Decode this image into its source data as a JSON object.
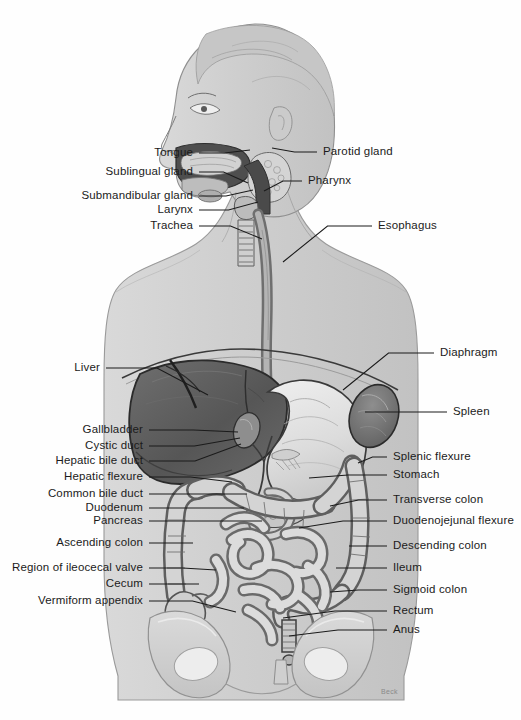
{
  "figure": {
    "signature": "Beck",
    "background_color": "#fefefe",
    "ink_color": "#1b1b1b"
  },
  "labels_left": [
    {
      "text": "Tongue",
      "x": 193,
      "y": 153,
      "tx": 250,
      "ty": 150
    },
    {
      "text": "Sublingual gland",
      "x": 193,
      "y": 172,
      "tx": 248,
      "ty": 183
    },
    {
      "text": "Submandibular gland",
      "x": 193,
      "y": 196,
      "tx": 253,
      "ty": 190
    },
    {
      "text": "Larynx",
      "x": 193,
      "y": 210,
      "tx": 258,
      "ty": 202
    },
    {
      "text": "Trachea",
      "x": 193,
      "y": 226,
      "tx": 262,
      "ty": 239
    },
    {
      "text": "Liver",
      "x": 100,
      "y": 368,
      "tx": 208,
      "ty": 395
    },
    {
      "text": "Gallbladder",
      "x": 143,
      "y": 430,
      "tx": 238,
      "ty": 432
    },
    {
      "text": "Cystic duct",
      "x": 143,
      "y": 446,
      "tx": 240,
      "ty": 438
    },
    {
      "text": "Hepatic bile duct",
      "x": 143,
      "y": 461,
      "tx": 241,
      "ty": 444
    },
    {
      "text": "Hepatic flexure",
      "x": 143,
      "y": 477,
      "tx": 232,
      "ty": 482
    },
    {
      "text": "Common bile duct",
      "x": 143,
      "y": 494,
      "tx": 247,
      "ty": 494
    },
    {
      "text": "Duodenum",
      "x": 143,
      "y": 508,
      "tx": 244,
      "ty": 508
    },
    {
      "text": "Pancreas",
      "x": 143,
      "y": 521,
      "tx": 262,
      "ty": 521
    },
    {
      "text": "Ascending colon",
      "x": 143,
      "y": 543,
      "tx": 193,
      "ty": 543
    },
    {
      "text": "Region of ileocecal valve",
      "x": 143,
      "y": 568,
      "tx": 216,
      "ty": 570
    },
    {
      "text": "Cecum",
      "x": 143,
      "y": 584,
      "tx": 199,
      "ty": 584
    },
    {
      "text": "Vermiform appendix",
      "x": 143,
      "y": 601,
      "tx": 236,
      "ty": 612
    }
  ],
  "labels_right": [
    {
      "text": "Parotid gland",
      "x": 323,
      "y": 152,
      "tx": 272,
      "ty": 148
    },
    {
      "text": "Pharynx",
      "x": 308,
      "y": 181,
      "tx": 264,
      "ty": 191
    },
    {
      "text": "Esophagus",
      "x": 378,
      "y": 226,
      "tx": 283,
      "ty": 262
    },
    {
      "text": "Diaphragm",
      "x": 440,
      "y": 353,
      "tx": 343,
      "ty": 390
    },
    {
      "text": "Spleen",
      "x": 453,
      "y": 412,
      "tx": 365,
      "ty": 412
    },
    {
      "text": "Splenic flexure",
      "x": 393,
      "y": 457,
      "tx": 358,
      "ty": 463
    },
    {
      "text": "Stomach",
      "x": 393,
      "y": 475,
      "tx": 309,
      "ty": 478
    },
    {
      "text": "Transverse colon",
      "x": 393,
      "y": 500,
      "tx": 330,
      "ty": 506
    },
    {
      "text": "Duodenojejunal flexure",
      "x": 393,
      "y": 521,
      "tx": 299,
      "ty": 528
    },
    {
      "text": "Descending colon",
      "x": 393,
      "y": 546,
      "tx": 349,
      "ty": 546
    },
    {
      "text": "Ileum",
      "x": 393,
      "y": 568,
      "tx": 336,
      "ty": 568
    },
    {
      "text": "Sigmoid colon",
      "x": 393,
      "y": 590,
      "tx": 330,
      "ty": 592
    },
    {
      "text": "Rectum",
      "x": 393,
      "y": 611,
      "tx": 283,
      "ty": 618
    },
    {
      "text": "Anus",
      "x": 393,
      "y": 630,
      "tx": 289,
      "ty": 636
    }
  ],
  "anatomy_regions": [
    "head-profile",
    "neck",
    "torso-silhouette",
    "liver",
    "stomach",
    "spleen",
    "gallbladder",
    "pancreas",
    "duodenum",
    "small-intestine",
    "ascending-colon",
    "transverse-colon",
    "descending-colon",
    "sigmoid-colon",
    "rectum",
    "cecum",
    "vermiform-appendix",
    "esophagus",
    "diaphragm",
    "pelvis-bone"
  ]
}
